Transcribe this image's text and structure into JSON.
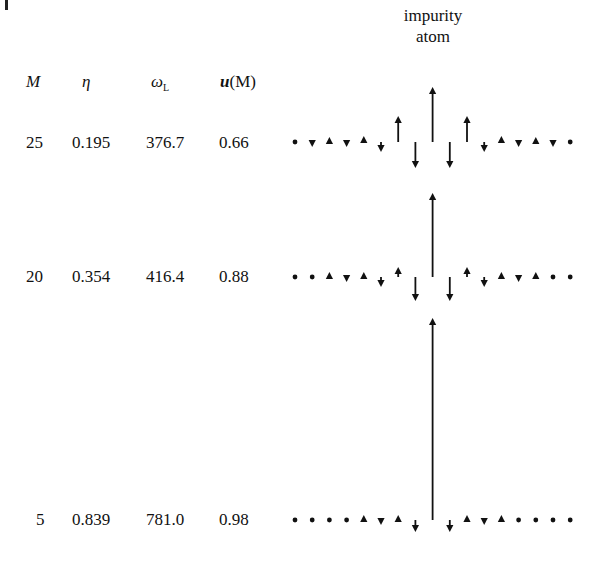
{
  "header": {
    "col_M": "M",
    "col_eta": "η",
    "col_omega": "ω",
    "col_omega_sub": "L",
    "col_u": "u",
    "col_u_arg": "(M)"
  },
  "annotation": {
    "line1": "impurity",
    "line2": "atom"
  },
  "rows": [
    {
      "M": "25",
      "eta": "0.195",
      "omega_L": "376.7",
      "uM": "0.66",
      "baseline_y": 142,
      "displacements": [
        0,
        -3,
        3,
        -3,
        6,
        -10,
        26,
        -26,
        55,
        -26,
        26,
        -10,
        6,
        -3,
        3,
        -3,
        0
      ]
    },
    {
      "M": "20",
      "eta": "0.354",
      "omega_L": "416.4",
      "uM": "0.88",
      "baseline_y": 277,
      "displacements": [
        0,
        0,
        3,
        -3,
        3,
        -10,
        10,
        -24,
        84,
        -24,
        10,
        -10,
        3,
        -3,
        3,
        0,
        0
      ]
    },
    {
      "M": "5",
      "eta": "0.839",
      "omega_L": "781.0",
      "uM": "0.98",
      "baseline_y": 520,
      "displacements": [
        0,
        0,
        0,
        0,
        3,
        -3,
        3,
        -12,
        202,
        -12,
        3,
        -3,
        3,
        0,
        0,
        0,
        0
      ]
    }
  ],
  "lattice": {
    "x_start": 295,
    "spacing": 17.2,
    "sites": 17
  }
}
